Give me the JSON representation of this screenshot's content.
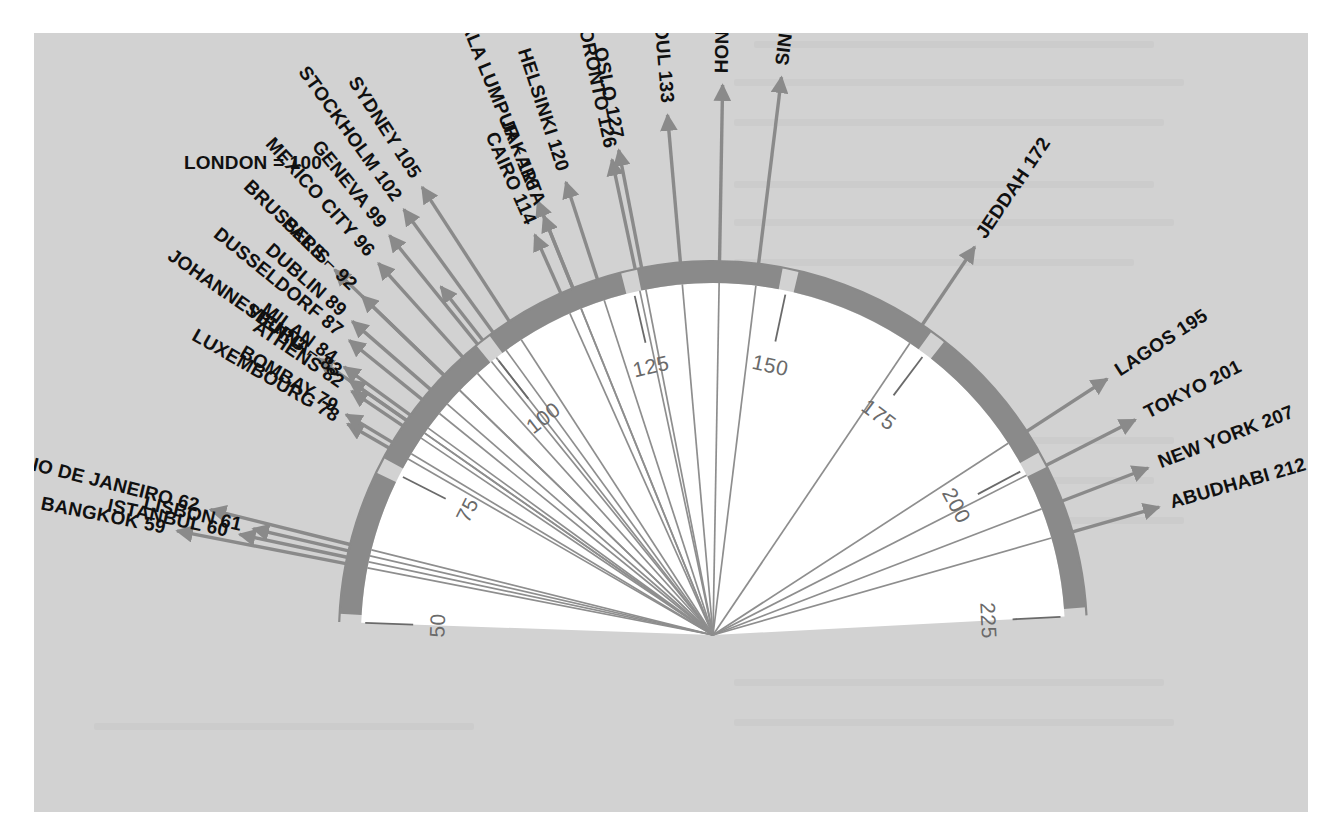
{
  "figure": {
    "baseline_label": "LONDON = 100",
    "background_color": "#d2d2d2",
    "band_color": "#8a8a8a",
    "interior_color": "#ffffff",
    "label_color": "#101010",
    "scale_color": "#6a6a6a"
  },
  "scale": {
    "ticks": [
      "50",
      "75",
      "100",
      "125",
      "150",
      "175",
      "200",
      "225"
    ],
    "min": 50,
    "max": 225,
    "step": 25
  },
  "chart_data": {
    "type": "fan",
    "title": "LONDON = 100",
    "xlabel": "",
    "ylabel": "Cost of living index",
    "axis_range": [
      50,
      225
    ],
    "axis_ticks": [
      50,
      75,
      100,
      125,
      150,
      175,
      200,
      225
    ],
    "grid": false,
    "legend": "none",
    "categories": [
      "BANGKOK",
      "ISTANBUL",
      "LISBON",
      "RIO DE JANEIRO",
      "LUXEMBOURG",
      "BOMBAY",
      "ATHENS",
      "VIENNA",
      "JOHANNESBURG",
      "MILAN",
      "DUSSELDORF",
      "DUBLIN",
      "PARIS",
      "BRUSSELS",
      "MEXICO CITY",
      "GENEVA",
      "LONDON",
      "STOCKHOLM",
      "SYDNEY",
      "CAIRO",
      "JAKARTA",
      "KUALA LUMPUR",
      "HELSINKI",
      "TORONTO",
      "OSLO",
      "SEOUL",
      "HONG KONG",
      "SINGAPORE",
      "JEDDAH",
      "LAGOS",
      "TOKYO",
      "NEW YORK",
      "ABUDHABI"
    ],
    "values": [
      59,
      60,
      61,
      62,
      78,
      79,
      82,
      83,
      83,
      84,
      87,
      89,
      92,
      92,
      96,
      99,
      100,
      102,
      105,
      114,
      116,
      116,
      120,
      126,
      127,
      133,
      139,
      145,
      172,
      195,
      201,
      207,
      212
    ]
  },
  "labels": [
    {
      "name": "BANGKOK",
      "value": "59",
      "text": "BANGKOK 59",
      "side": "left",
      "group": "bottom-left",
      "bracket": true
    },
    {
      "name": "ISTANBUL",
      "value": "60",
      "text": "ISTANBUL 60",
      "side": "left",
      "group": "bottom-left",
      "bracket": false
    },
    {
      "name": "LISBON",
      "value": "61",
      "text": "LISBON 61",
      "side": "left",
      "group": "bottom-left",
      "bracket": false
    },
    {
      "name": "RIO DE JANEIRO",
      "value": "62",
      "text": "RIO DE JANEIRO 62",
      "side": "left",
      "group": "bottom-left",
      "bracket": true
    },
    {
      "name": "LUXEMBOURG",
      "value": "78",
      "text": "LUXEMBOURG 78",
      "side": "left",
      "group": "mid-left",
      "bracket": false
    },
    {
      "name": "BOMBAY",
      "value": "79",
      "text": "BOMBAY 79",
      "side": "left",
      "group": "mid-left",
      "bracket": false
    },
    {
      "name": "ATHENS",
      "value": "82",
      "text": "ATHENS 82",
      "side": "left",
      "group": "mid-left",
      "bracket": false
    },
    {
      "name": "VIENNA",
      "value": "83",
      "text": "VIENNA",
      "side": "left",
      "group": "mid-left",
      "bracket": false
    },
    {
      "name": "JOHANNESBURG",
      "value": "83",
      "text": "JOHANNESBURG ⌐ 83",
      "side": "left",
      "group": "mid-left",
      "bracket": true
    },
    {
      "name": "MILAN",
      "value": "84",
      "text": "MILAN 84",
      "side": "left",
      "group": "upper-left",
      "bracket": false
    },
    {
      "name": "DUSSELDORF",
      "value": "87",
      "text": "DUSSELDORF 87",
      "side": "left",
      "group": "upper-left",
      "bracket": false
    },
    {
      "name": "DUBLIN",
      "value": "89",
      "text": "DUBLIN 89",
      "side": "left",
      "group": "upper-left",
      "bracket": false
    },
    {
      "name": "PARIS",
      "value": "92",
      "text": "PARIS",
      "side": "left",
      "group": "upper-left",
      "bracket": false
    },
    {
      "name": "BRUSSELS",
      "value": "92",
      "text": "BRUSSELS ⌐ 92",
      "side": "left",
      "group": "upper-left",
      "bracket": true
    },
    {
      "name": "MEXICO CITY",
      "value": "96",
      "text": "MEXICO CITY 96",
      "side": "left",
      "group": "upper-left",
      "bracket": false
    },
    {
      "name": "GENEVA",
      "value": "99",
      "text": "GENEVA 99",
      "side": "left",
      "group": "upper-left",
      "bracket": false
    },
    {
      "name": "LONDON",
      "value": "100",
      "text": "LONDON = 100",
      "side": "top",
      "group": "baseline",
      "bracket": false
    },
    {
      "name": "STOCKHOLM",
      "value": "102",
      "text": "STOCKHOLM 102",
      "side": "left",
      "group": "upper-left",
      "bracket": false
    },
    {
      "name": "SYDNEY",
      "value": "105",
      "text": "SYDNEY 105",
      "side": "left",
      "group": "upper-left",
      "bracket": false
    },
    {
      "name": "CAIRO",
      "value": "114",
      "text": "CAIRO 114",
      "side": "top",
      "group": "top",
      "bracket": false
    },
    {
      "name": "JAKARTA",
      "value": "116",
      "text": "JAKARTA",
      "side": "top",
      "group": "top",
      "bracket": false
    },
    {
      "name": "KUALA LUMPUR",
      "value": "116",
      "text": "KUALA LUMPUR ⌐ 116",
      "side": "top",
      "group": "top",
      "bracket": true
    },
    {
      "name": "HELSINKI",
      "value": "120",
      "text": "HELSINKI 120",
      "side": "top",
      "group": "top",
      "bracket": true
    },
    {
      "name": "TORONTO",
      "value": "126",
      "text": "TORONTO 126",
      "side": "top",
      "group": "top",
      "bracket": false
    },
    {
      "name": "OSLO",
      "value": "127",
      "text": "OSLO 127",
      "side": "top",
      "group": "top",
      "bracket": false
    },
    {
      "name": "SEOUL",
      "value": "133",
      "text": "SEOUL 133",
      "side": "top",
      "group": "top",
      "bracket": false
    },
    {
      "name": "HONG KONG",
      "value": "139",
      "text": "HONG KONG 139",
      "side": "top",
      "group": "top",
      "bracket": false
    },
    {
      "name": "SINGAPORE",
      "value": "145",
      "text": "SINGAPORE 145",
      "side": "top",
      "group": "top",
      "bracket": false
    },
    {
      "name": "JEDDAH",
      "value": "172",
      "text": "JEDDAH 172",
      "side": "right",
      "group": "upper-right",
      "bracket": false
    },
    {
      "name": "LAGOS",
      "value": "195",
      "text": "LAGOS 195",
      "side": "right",
      "group": "right",
      "bracket": false
    },
    {
      "name": "TOKYO",
      "value": "201",
      "text": "TOKYO 201",
      "side": "right",
      "group": "right",
      "bracket": false
    },
    {
      "name": "NEW YORK",
      "value": "207",
      "text": "NEW YORK 207",
      "side": "right",
      "group": "right",
      "bracket": false
    },
    {
      "name": "ABUDHABI",
      "value": "212",
      "text": "ABUDHABI 212",
      "side": "right",
      "group": "right",
      "bracket": false
    }
  ]
}
